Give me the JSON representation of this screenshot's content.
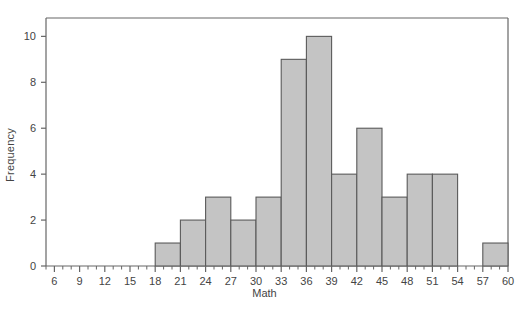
{
  "chart_data": {
    "type": "bar",
    "title": "",
    "xlabel": "Math",
    "ylabel": "Frequency",
    "xlim": [
      5,
      60
    ],
    "ylim": [
      0,
      10.8
    ],
    "bin_width": 3,
    "grid": false,
    "legend": null,
    "bar_fill_color": "#c4c4c4",
    "bar_edge_color": "#5a5a5a",
    "axis_color": "#666666",
    "text_color": "#444444",
    "xticks": [
      6,
      9,
      12,
      15,
      18,
      21,
      24,
      27,
      30,
      33,
      36,
      39,
      42,
      45,
      48,
      51,
      54,
      57,
      60
    ],
    "xtick_labels": [
      "6",
      "9",
      "12",
      "15",
      "18",
      "21",
      "24",
      "27",
      "30",
      "33",
      "36",
      "39",
      "42",
      "45",
      "48",
      "51",
      "54",
      "57",
      "60"
    ],
    "xminor_step": 1,
    "yticks": [
      0,
      2,
      4,
      6,
      8,
      10
    ],
    "ytick_labels": [
      "0",
      "2",
      "4",
      "6",
      "8",
      "10"
    ],
    "bins": [
      {
        "start": 18,
        "end": 21,
        "value": 1
      },
      {
        "start": 21,
        "end": 24,
        "value": 2
      },
      {
        "start": 24,
        "end": 27,
        "value": 3
      },
      {
        "start": 27,
        "end": 30,
        "value": 2
      },
      {
        "start": 30,
        "end": 33,
        "value": 3
      },
      {
        "start": 33,
        "end": 36,
        "value": 9
      },
      {
        "start": 36,
        "end": 39,
        "value": 10
      },
      {
        "start": 39,
        "end": 42,
        "value": 4
      },
      {
        "start": 42,
        "end": 45,
        "value": 6
      },
      {
        "start": 45,
        "end": 48,
        "value": 3
      },
      {
        "start": 48,
        "end": 51,
        "value": 4
      },
      {
        "start": 51,
        "end": 54,
        "value": 4
      },
      {
        "start": 54,
        "end": 57,
        "value": 0
      },
      {
        "start": 57,
        "end": 60,
        "value": 1
      }
    ],
    "categories": [
      "18-21",
      "21-24",
      "24-27",
      "27-30",
      "30-33",
      "33-36",
      "36-39",
      "39-42",
      "42-45",
      "45-48",
      "48-51",
      "51-54",
      "54-57",
      "57-60"
    ],
    "values": [
      1,
      2,
      3,
      2,
      3,
      9,
      10,
      4,
      6,
      3,
      4,
      4,
      0,
      1
    ]
  }
}
